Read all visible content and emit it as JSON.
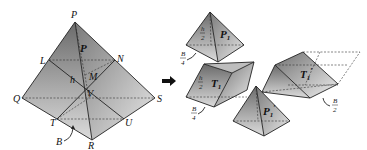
{
  "figure": {
    "type": "pyramid-decomposition",
    "left_pyramid": {
      "vertices": [
        "P",
        "Q",
        "R",
        "S"
      ],
      "points": [
        "L",
        "N",
        "M",
        "T",
        "U",
        "V"
      ],
      "labels": {
        "apex": "P",
        "face_label": "P",
        "L": "L",
        "N": "N",
        "M": "M",
        "h": "h",
        "V": "V",
        "Q": "Q",
        "S": "S",
        "T": "T",
        "U": "U",
        "R": "R",
        "B": "B"
      }
    },
    "arrow": "right-arrow",
    "pieces": {
      "P1": {
        "label": "P",
        "sub": "1",
        "height_num": "h",
        "height_den": "2",
        "base_num": "B",
        "base_den": "4"
      },
      "T1": {
        "label": "T",
        "sub": "1",
        "height_num": "h",
        "height_den": "2",
        "base_num": "B",
        "base_den": "4"
      },
      "T1prime": {
        "label": "T",
        "sub": "1",
        "prime": "′",
        "base_num": "B",
        "base_den": "2"
      },
      "P1prime": {
        "label": "P",
        "sub": "1",
        "prime": "′"
      }
    }
  }
}
